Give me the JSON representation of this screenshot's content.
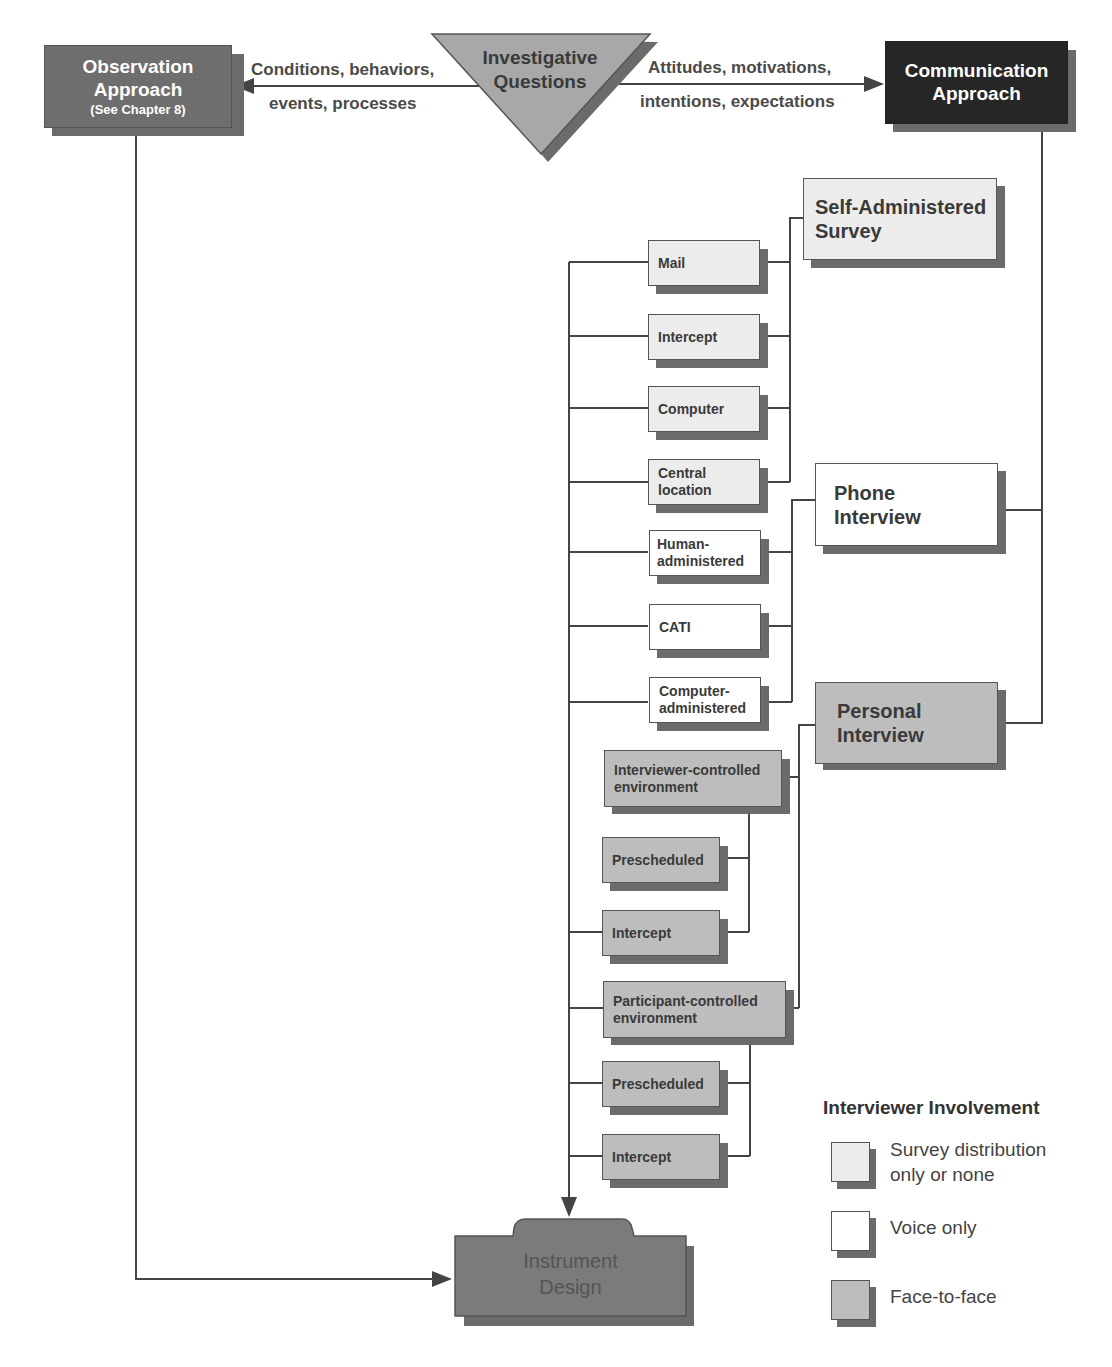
{
  "top": {
    "observation": {
      "line1": "Observation",
      "line2": "Approach",
      "line3": "(See Chapter 8)"
    },
    "investigative": {
      "line1": "Investigative",
      "line2": "Questions"
    },
    "communication": {
      "line1": "Communication",
      "line2": "Approach"
    },
    "left_arrow_label": {
      "line1": "Conditions, behaviors,",
      "line2": "events, processes"
    },
    "right_arrow_label": {
      "line1": "Attitudes, motivations,",
      "line2": "intentions, expectations"
    }
  },
  "categories": {
    "self_administered": {
      "line1": "Self-Administered",
      "line2": "Survey"
    },
    "phone": {
      "line1": "Phone",
      "line2": "Interview"
    },
    "personal": {
      "line1": "Personal",
      "line2": "Interview"
    }
  },
  "methods": {
    "mail": "Mail",
    "intercept_sa": "Intercept",
    "computer": "Computer",
    "central_location": {
      "line1": "Central",
      "line2": "location"
    },
    "human_administered": {
      "line1": "Human-",
      "line2": "administered"
    },
    "cati": "CATI",
    "computer_administered": {
      "line1": "Computer-",
      "line2": "administered"
    },
    "interviewer_controlled": {
      "line1": "Interviewer-controlled",
      "line2": "environment"
    },
    "prescheduled_ic": "Prescheduled",
    "intercept_ic": "Intercept",
    "participant_controlled": {
      "line1": "Participant-controlled",
      "line2": "environment"
    },
    "prescheduled_pc": "Prescheduled",
    "intercept_pc": "Intercept"
  },
  "instrument": {
    "line1": "Instrument",
    "line2": "Design"
  },
  "legend": {
    "title": "Interviewer Involvement",
    "items": [
      {
        "line1": "Survey distribution",
        "line2": "only or none",
        "color": "#ececec"
      },
      {
        "line1": "Voice only",
        "line2": "",
        "color": "#ffffff"
      },
      {
        "line1": "Face-to-face",
        "line2": "",
        "color": "#bdbdbd"
      }
    ]
  },
  "colors": {
    "observation": "#6e6e6e",
    "communication": "#262626",
    "triangle": "#a8a8a8",
    "instrument": "#7b7b7b",
    "line": "#444444"
  }
}
